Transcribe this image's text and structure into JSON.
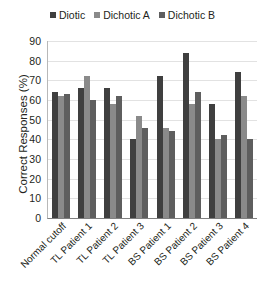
{
  "chart_data": {
    "type": "bar",
    "title": "",
    "xlabel": "",
    "ylabel": "Correct Responses (%)",
    "ylim": [
      0,
      90
    ],
    "yticks": [
      0,
      10,
      20,
      30,
      40,
      50,
      60,
      70,
      80,
      90
    ],
    "grid": true,
    "legend_position": "top-center",
    "categories": [
      "Normal cutoff",
      "TL Patient 1",
      "TL Patient 2",
      "TL Patient 3",
      "BS Patient 1",
      "BS Patient 2",
      "BS Patient 3",
      "BS Patient 4"
    ],
    "series": [
      {
        "name": "Diotic",
        "color": "#3f3f3f",
        "values": [
          64,
          66,
          66,
          40,
          72,
          84,
          58,
          74
        ]
      },
      {
        "name": "Dichotic A",
        "color": "#8a8a8a",
        "values": [
          62,
          72,
          58,
          52,
          46,
          58,
          40,
          62
        ]
      },
      {
        "name": "Dichotic B",
        "color": "#5e5e5e",
        "values": [
          63,
          60,
          62,
          46,
          44,
          64,
          42,
          40
        ]
      }
    ]
  }
}
